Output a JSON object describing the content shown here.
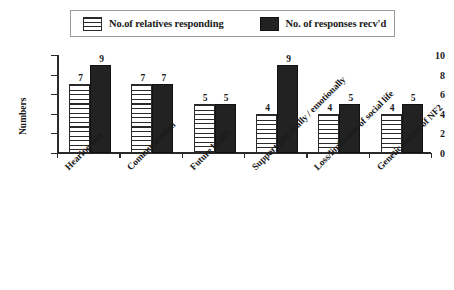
{
  "chart_data": {
    "type": "bar",
    "title": "",
    "xlabel": "",
    "ylabel": "Numbers",
    "ylim": [
      0,
      10
    ],
    "yticks": [
      0,
      2,
      4,
      6,
      8,
      10
    ],
    "grid": false,
    "legend_position": "top",
    "categories": [
      "Hearing loss",
      "Communication",
      "Future health",
      "Support physically / emotionally",
      "Loss/limitation of social life",
      "Genetic nature of NF2"
    ],
    "series": [
      {
        "name": "No.of relatives responding",
        "fill": "horizontal-hatch",
        "color": "#ffffff",
        "values": [
          7,
          7,
          5,
          4,
          4,
          4
        ]
      },
      {
        "name": "No. of responses recv'd",
        "fill": "solid",
        "color": "#222222",
        "values": [
          9,
          7,
          5,
          9,
          5,
          5
        ]
      }
    ]
  },
  "legend": {
    "entries": [
      {
        "label": "No.of relatives responding",
        "swatch": "hatch-swatch-icon"
      },
      {
        "label": "No. of responses recv'd",
        "swatch": "solid-swatch-icon"
      }
    ]
  },
  "caption": {
    "text": ""
  }
}
